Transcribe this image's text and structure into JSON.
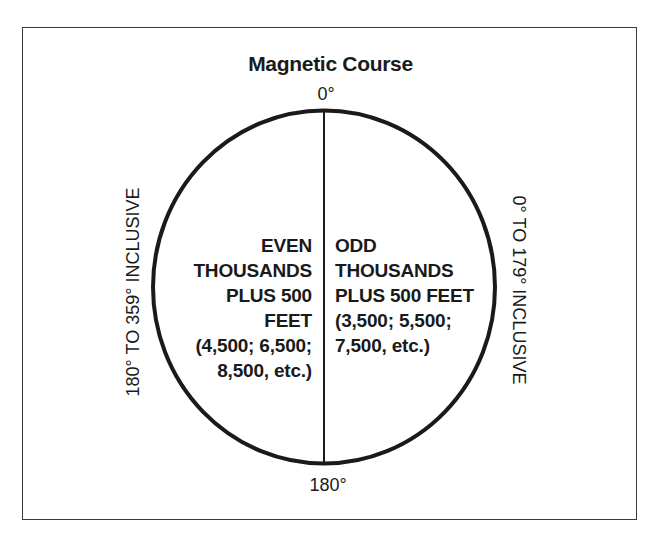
{
  "diagram": {
    "title": "Magnetic Course",
    "compass": {
      "top_label": "0°",
      "bottom_label": "180°"
    },
    "sides": {
      "left_label": "180° TO 359° INCLUSIVE",
      "right_label": "0° TO 179° INCLUSIVE"
    },
    "halves": {
      "left": {
        "lines": [
          "EVEN",
          "THOUSANDS",
          "PLUS 500",
          "FEET",
          "(4,500; 6,500;",
          "8,500, etc.)"
        ]
      },
      "right": {
        "lines": [
          "ODD",
          "THOUSANDS",
          "PLUS 500 FEET",
          "(3,500; 5,500;",
          "7,500, etc.)"
        ]
      }
    },
    "colors": {
      "ink": "#1a1a1a",
      "frame": "#3a3a3a",
      "background": "#ffffff"
    }
  }
}
